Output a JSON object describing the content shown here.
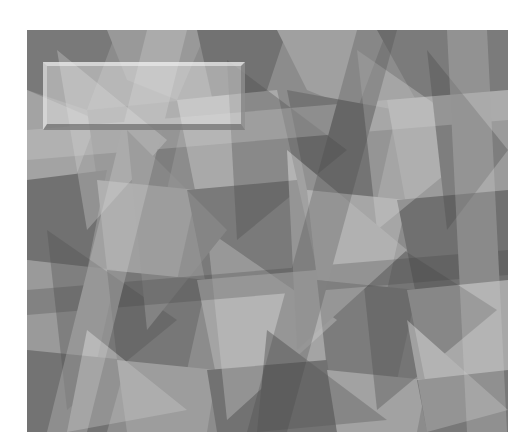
{
  "image": {
    "description": "abstract geometric pattern of overlapping translucent gray polygons",
    "palette": [
      "#5a5a5a",
      "#707070",
      "#8a8a8a",
      "#a0a0a0",
      "#b8b8b8",
      "#cfcfcf"
    ],
    "overlay_box": {
      "style": "beveled translucent light rectangle",
      "text": ""
    }
  },
  "caption": {
    "text": ""
  }
}
